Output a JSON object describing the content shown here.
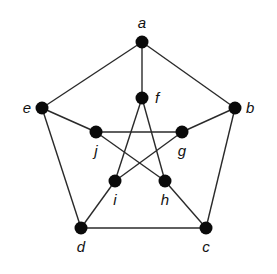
{
  "diagram": {
    "type": "graph",
    "name": "Petersen graph",
    "colors": {
      "edge": "#2a2a2a",
      "node": "#0a0a0a",
      "label": "#111111",
      "background": "#ffffff"
    },
    "nodes": [
      {
        "id": "a",
        "label": "a",
        "x": 142,
        "y": 42,
        "lx": 142,
        "ly": 28,
        "anchor": "middle"
      },
      {
        "id": "b",
        "label": "b",
        "x": 235,
        "y": 108,
        "lx": 246,
        "ly": 113,
        "anchor": "start"
      },
      {
        "id": "c",
        "label": "c",
        "x": 206,
        "y": 228,
        "lx": 206,
        "ly": 252,
        "anchor": "middle"
      },
      {
        "id": "d",
        "label": "d",
        "x": 81,
        "y": 228,
        "lx": 81,
        "ly": 252,
        "anchor": "middle"
      },
      {
        "id": "e",
        "label": "e",
        "x": 42,
        "y": 108,
        "lx": 31,
        "ly": 113,
        "anchor": "end"
      },
      {
        "id": "f",
        "label": "f",
        "x": 142,
        "y": 98,
        "lx": 155,
        "ly": 103,
        "anchor": "start"
      },
      {
        "id": "g",
        "label": "g",
        "x": 182,
        "y": 132,
        "lx": 182,
        "ly": 156,
        "anchor": "middle"
      },
      {
        "id": "h",
        "label": "h",
        "x": 165,
        "y": 181,
        "lx": 165,
        "ly": 205,
        "anchor": "middle"
      },
      {
        "id": "i",
        "label": "i",
        "x": 115,
        "y": 181,
        "lx": 115,
        "ly": 205,
        "anchor": "middle"
      },
      {
        "id": "j",
        "label": "j",
        "x": 96,
        "y": 132,
        "lx": 96,
        "ly": 156,
        "anchor": "middle"
      }
    ],
    "edges": [
      [
        "a",
        "b"
      ],
      [
        "b",
        "c"
      ],
      [
        "c",
        "d"
      ],
      [
        "d",
        "e"
      ],
      [
        "e",
        "a"
      ],
      [
        "a",
        "f"
      ],
      [
        "b",
        "g"
      ],
      [
        "c",
        "h"
      ],
      [
        "d",
        "i"
      ],
      [
        "e",
        "j"
      ],
      [
        "f",
        "i"
      ],
      [
        "f",
        "h"
      ],
      [
        "j",
        "g"
      ],
      [
        "j",
        "h"
      ],
      [
        "g",
        "i"
      ]
    ]
  }
}
